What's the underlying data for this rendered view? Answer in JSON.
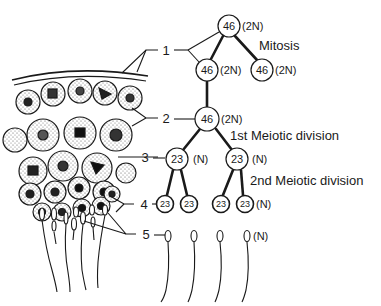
{
  "labels": {
    "level_1": "1",
    "level_2": "2",
    "level_3": "3",
    "level_4": "4",
    "level_5": "5"
  },
  "stages": {
    "mitosis": "Mitosis",
    "meiosis_1": "1st Meiotic division",
    "meiosis_2": "2nd Meiotic division"
  },
  "nodes": {
    "top": {
      "count": "46",
      "ploidy": "(2N)"
    },
    "mitosis_left": {
      "count": "46",
      "ploidy": "(2N)"
    },
    "mitosis_right": {
      "count": "46",
      "ploidy": "(2N)"
    },
    "primary": {
      "count": "46",
      "ploidy": "(2N)"
    },
    "secondary_left": {
      "count": "23",
      "ploidy": "(N)"
    },
    "secondary_right": {
      "count": "23",
      "ploidy": "(N)"
    },
    "spermatid_1": {
      "count": "23"
    },
    "spermatid_2": {
      "count": "23"
    },
    "spermatid_3": {
      "count": "23"
    },
    "spermatid_4": {
      "count": "23",
      "ploidy": "(N)"
    },
    "sperm_ploidy": "(N)"
  },
  "colors": {
    "ink": "#1a1a1a",
    "background": "#ffffff",
    "stipple": "#555555"
  }
}
